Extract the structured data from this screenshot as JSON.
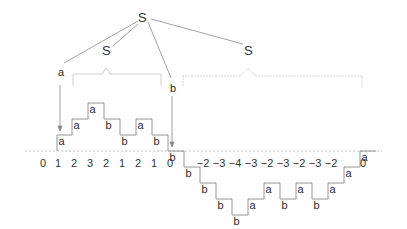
{
  "tree": {
    "root": {
      "label": "S",
      "x": 143,
      "y": 22
    },
    "left_child": {
      "label": "S",
      "x": 107,
      "y": 55
    },
    "right_child": {
      "label": "S",
      "x": 248,
      "y": 55
    },
    "leaf_a": {
      "label": "a",
      "x": 61,
      "y": 76
    },
    "leaf_b": {
      "label": "b",
      "x": 173,
      "y": 92
    }
  },
  "path": {
    "baseline_y": 151,
    "step_px": 16,
    "steps": [
      {
        "label": "a",
        "x": 57,
        "from": 0,
        "to": 1
      },
      {
        "label": "a",
        "x": 72,
        "from": 1,
        "to": 2
      },
      {
        "label": "a",
        "x": 88,
        "from": 2,
        "to": 3
      },
      {
        "label": "b",
        "x": 104,
        "from": 3,
        "to": 2
      },
      {
        "label": "b",
        "x": 120,
        "from": 2,
        "to": 1
      },
      {
        "label": "a",
        "x": 136,
        "from": 1,
        "to": 2
      },
      {
        "label": "b",
        "x": 152,
        "from": 2,
        "to": 1
      },
      {
        "label": "b",
        "x": 168,
        "from": 1,
        "to": 0
      },
      {
        "label": "b",
        "x": 184,
        "from": 0,
        "to": -1
      },
      {
        "label": "b",
        "x": 200,
        "from": -1,
        "to": -2
      },
      {
        "label": "b",
        "x": 216,
        "from": -2,
        "to": -3
      },
      {
        "label": "b",
        "x": 232,
        "from": -3,
        "to": -4
      },
      {
        "label": "a",
        "x": 248,
        "from": -4,
        "to": -3
      },
      {
        "label": "a",
        "x": 264,
        "from": -3,
        "to": -2
      },
      {
        "label": "b",
        "x": 280,
        "from": -2,
        "to": -3
      },
      {
        "label": "a",
        "x": 296,
        "from": -3,
        "to": -2
      },
      {
        "label": "b",
        "x": 312,
        "from": -2,
        "to": -3
      },
      {
        "label": "a",
        "x": 328,
        "from": -3,
        "to": -2
      },
      {
        "label": "a",
        "x": 344,
        "from": -2,
        "to": -1
      },
      {
        "label": "a",
        "x": 360,
        "from": -1,
        "to": 0
      }
    ]
  },
  "heights": {
    "labels": [
      "0",
      "1",
      "2",
      "3",
      "2",
      "1",
      "2",
      "1",
      "0",
      "",
      "−2",
      "−3",
      "−4",
      "−3",
      "−2",
      "−3",
      "−2",
      "−3",
      "−2",
      "",
      "0"
    ]
  },
  "colors": {
    "line": "#888888",
    "brace": "#cccccc",
    "text": "#2a2a2a"
  }
}
